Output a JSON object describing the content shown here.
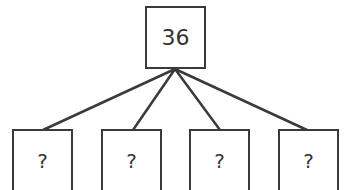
{
  "diagram": {
    "type": "tree",
    "root": {
      "label": "36"
    },
    "children": [
      {
        "label": "?"
      },
      {
        "label": "?"
      },
      {
        "label": "?"
      },
      {
        "label": "?"
      }
    ]
  },
  "colors": {
    "stroke": "#3a3a3a",
    "text": "#333333",
    "background": "#ffffff"
  }
}
